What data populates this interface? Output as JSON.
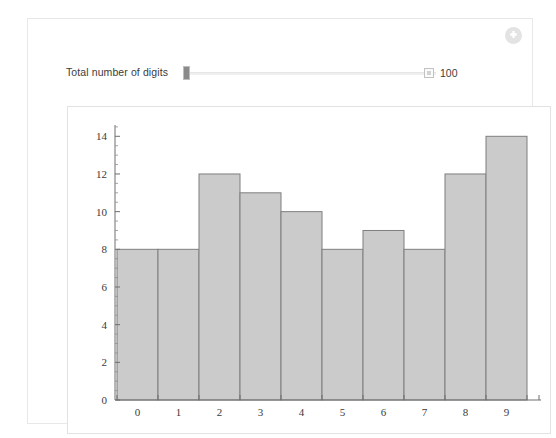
{
  "window": {
    "background_color": "#ffffff",
    "panel_border_color": "#e8e8e8"
  },
  "toolbar": {
    "add_button_name": "add-cell-button",
    "add_icon": "plus-circle-icon",
    "add_icon_color": "#e3e3e3"
  },
  "controls": {
    "slider": {
      "label": "Total number of digits",
      "value": "100",
      "handle_position_percent": 0,
      "track_color": "#efefef",
      "handle_color": "#8a8a8a",
      "value_icon": "input-field-icon"
    }
  },
  "chart_data": {
    "type": "bar",
    "title": "",
    "subtitle": "",
    "xlabel": "",
    "ylabel": "",
    "categories": [
      "0",
      "1",
      "2",
      "3",
      "4",
      "5",
      "6",
      "7",
      "8",
      "9"
    ],
    "values": [
      8,
      8,
      12,
      11,
      10,
      8,
      9,
      8,
      12,
      14
    ],
    "ylim": [
      0,
      14.6
    ],
    "xlim": [
      -0.5,
      9.5
    ],
    "y_ticks_major": [
      0,
      2,
      4,
      6,
      8,
      10,
      12,
      14
    ],
    "y_tick_labels": [
      "0",
      "2",
      "4",
      "6",
      "8",
      "10",
      "12",
      "14"
    ],
    "y_minor_step": 0.5,
    "x_tick_labels": [
      "0",
      "1",
      "2",
      "3",
      "4",
      "5",
      "6",
      "7",
      "8",
      "9"
    ],
    "grid": false,
    "legend": null,
    "bar_fill_color": "#cbcbcb",
    "bar_edge_color": "#7f7f7f",
    "axis_color": "#6e6e6e",
    "total": 100
  }
}
